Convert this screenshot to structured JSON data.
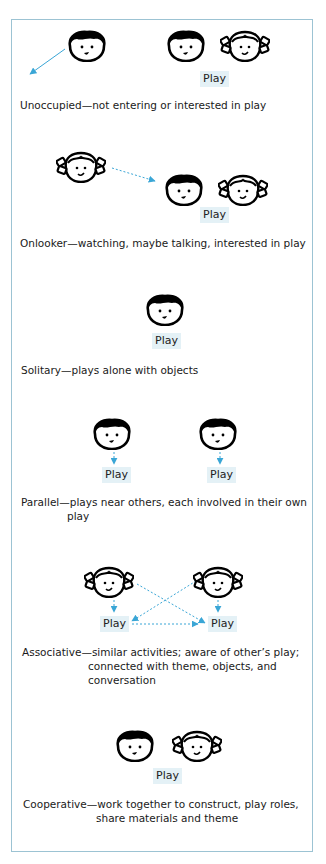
{
  "colors": {
    "frame": "#9cc3d3",
    "arrow": "#3aa6d6",
    "play_bg": "#e4f1f6",
    "text": "#1a1a1a"
  },
  "icons": {
    "boy": "boy-face-icon",
    "girl": "girl-face-icon",
    "arrow": "dashed-arrow-icon"
  },
  "stages": [
    {
      "name": "Unoccupied",
      "play_labels": [
        "Play"
      ],
      "label": "Unoccupied",
      "desc_lines": [
        "Unoccupied—not entering or interested in play"
      ]
    },
    {
      "name": "Onlooker",
      "play_labels": [
        "Play"
      ],
      "desc_lines": [
        "Onlooker—watching, maybe talking, interested in play"
      ]
    },
    {
      "name": "Solitary",
      "play_labels": [
        "Play"
      ],
      "desc_lines": [
        "Solitary—plays alone with objects"
      ]
    },
    {
      "name": "Parallel",
      "play_labels": [
        "Play",
        "Play"
      ],
      "desc_lines": [
        "Parallel—plays near others, each involved in their own",
        "play"
      ]
    },
    {
      "name": "Associative",
      "play_labels": [
        "Play",
        "Play"
      ],
      "desc_lines": [
        "Associative—similar activities; aware of other’s play;",
        "connected with theme, objects, and",
        "conversation"
      ]
    },
    {
      "name": "Cooperative",
      "play_labels": [
        "Play"
      ],
      "desc_lines": [
        "Cooperative—work together to construct, play roles,",
        "share materials and theme"
      ]
    }
  ]
}
